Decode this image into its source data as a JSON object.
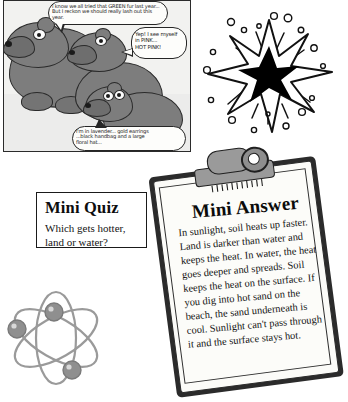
{
  "page": {
    "title": "Mini Quiz and Mini Answer worksheet"
  },
  "cartoon": {
    "name": "bears-cartoon-panel",
    "bubbles": [
      {
        "id": "bubble-top-left",
        "line1": "I know we all tried that GREEN fur last year...",
        "line2": "But I reckon we should really lash out this year."
      },
      {
        "id": "bubble-right",
        "line1": "Yep! I see myself",
        "line2": "in PINK...",
        "line3": "HOT PINK!"
      },
      {
        "id": "bubble-bottom",
        "line1": "I'm in lavender... gold earrings",
        "line2": "...black handbag and a large",
        "line3": "floral hat..."
      }
    ]
  },
  "starburst": {
    "name": "starburst-explosion-graphic",
    "label": "starburst",
    "fill": "#000000"
  },
  "atom": {
    "name": "atom-graphic",
    "label": "atom",
    "color": "#9a9a9a"
  },
  "quiz": {
    "heading": "Mini Quiz",
    "question_line1": "Which gets hotter,",
    "question_line2": "land or water?"
  },
  "answer": {
    "heading": "Mini Answer",
    "body": "In sunlight, soil heats up faster. Land is darker than water and keeps the heat. In water, the heat goes deeper and spreads. Soil keeps the heat on the surface. If you dig into hot sand on the beach, the sand underneath is cool. Sunlight can't pass through it and the surface stays hot."
  },
  "colors": {
    "bear_fill": "#7d7d7d",
    "ink": "#2a2a2a",
    "paper": "#fcfcf9",
    "clipboard": "#2b2b2b",
    "clip_metal": "#9a9a9a"
  }
}
